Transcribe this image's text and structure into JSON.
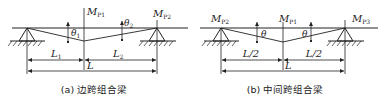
{
  "figure": {
    "panel_a": {
      "caption": "(a) 边跨组合梁",
      "moments": {
        "center": {
          "base": "M",
          "sub": "P1"
        },
        "right": {
          "base": "M",
          "sub": "P2"
        }
      },
      "angles": {
        "left": {
          "base": "θ",
          "sub": "1"
        },
        "right": {
          "base": "θ",
          "sub": "2"
        }
      },
      "dimensions": {
        "left": {
          "base": "L",
          "sub": "1"
        },
        "right": {
          "base": "L",
          "sub": "2"
        },
        "total": "L"
      }
    },
    "panel_b": {
      "caption": "(b) 中间跨组合梁",
      "moments": {
        "left": {
          "base": "M",
          "sub": "P2"
        },
        "center": {
          "base": "M",
          "sub": "P1"
        },
        "right": {
          "base": "M",
          "sub": "P3"
        }
      },
      "angles": {
        "left": "θ",
        "right": "θ"
      },
      "dimensions": {
        "left": "L/2",
        "right": "L/2",
        "total": "L"
      }
    },
    "colors": {
      "line": "#222222",
      "background": "#ffffff"
    }
  }
}
